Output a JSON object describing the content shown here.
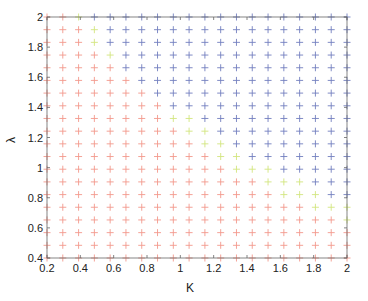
{
  "chart_data": {
    "type": "scatter",
    "title": "",
    "xlabel": "K",
    "ylabel": "λ",
    "xlim": [
      0.2,
      2
    ],
    "ylim": [
      0.4,
      2
    ],
    "grid": false,
    "legend": null,
    "marker": "+",
    "x_ticks": [
      "0.2",
      "0.4",
      "0.6",
      "0.8",
      "1",
      "1.2",
      "1.4",
      "1.6",
      "1.8",
      "2"
    ],
    "y_ticks": [
      "0.4",
      "0.6",
      "0.8",
      "1",
      "1.2",
      "1.4",
      "1.6",
      "1.8",
      "2"
    ],
    "grid_points": {
      "x": {
        "start": 0.2,
        "end": 2.0,
        "count": 20
      },
      "y": {
        "start": 2.0,
        "end": 0.4,
        "count": 20
      }
    },
    "classes": {
      "R": {
        "name": "red",
        "color": "#f08070"
      },
      "Y": {
        "name": "yellow-green",
        "color": "#c8e060"
      },
      "B": {
        "name": "blue",
        "color": "#5060b0"
      }
    },
    "rows_top_to_bottom": [
      "RRYBBBBBBBBBBBBBBBBB",
      "RRRYBBBBBBBBBBBBBBBB",
      "RRRYBBBBBBBBBBBBBBBB",
      "RRRRYBBBBBBBBBBBBBBB",
      "RRRRRBBBBBBBBBBBBBBB",
      "RRRRRRBBBBBBBBBBBBBB",
      "RRRRRRRBBBBBBBBBBBBB",
      "RRRRRRRRBBBBBBBBBBBB",
      "RRRRRRRRYYBBBBBBBBBB",
      "RRRRRRRRRYYBBBBBBBBB",
      "RRRRRRRRRRYYBBBBBBBB",
      "RRRRRRRRRRRYYBBBBBBB",
      "RRRRRRRRRRRRYYYBBBBB",
      "RRRRRRRRRRRRRRYYYBBB",
      "RRRRRRRRRRRRRRRYYYBB",
      "RRRRRRRRRRRRRRRRRYYY",
      "RRRRRRRRRRRRRRRRRRRY",
      "RRRRRRRRRRRRRRRRRRRR",
      "RRRRRRRRRRRRRRRRRRRR",
      "RRRRRRRRRRRRRRRRRRRR"
    ]
  }
}
